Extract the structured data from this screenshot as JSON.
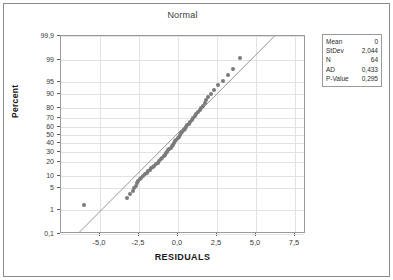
{
  "chart_data": {
    "type": "scatter",
    "title": "Normal",
    "subtitle": "",
    "xlabel": "RESIDUALS",
    "ylabel": "Percent",
    "grid": true,
    "xlim": [
      -7.5,
      8.2
    ],
    "xticks": [
      -5.0,
      -2.5,
      0.0,
      2.5,
      5.0,
      7.5
    ],
    "xticklabels": [
      "-5,0",
      "-2,5",
      "0,0",
      "2,5",
      "5,0",
      "7,5"
    ],
    "yscale": "normal-probability",
    "yticks": [
      0.1,
      1,
      5,
      10,
      20,
      30,
      40,
      50,
      60,
      70,
      80,
      90,
      95,
      99,
      99.9
    ],
    "yticklabels": [
      "0,1",
      "1",
      "5",
      "10",
      "20",
      "30",
      "40",
      "50",
      "60",
      "70",
      "80",
      "90",
      "95",
      "99",
      "99,9"
    ],
    "ylim": [
      0.1,
      99.9
    ],
    "series": [
      {
        "name": "residuals",
        "marker": "circle",
        "color": "#7a7a7a",
        "x": [
          -6.05,
          -3.3,
          -3.05,
          -2.9,
          -2.8,
          -2.72,
          -2.62,
          -2.55,
          -2.45,
          -2.35,
          -2.22,
          -2.1,
          -1.98,
          -1.9,
          -1.8,
          -1.72,
          -1.62,
          -1.52,
          -1.42,
          -1.3,
          -1.2,
          -1.1,
          -1.0,
          -0.92,
          -0.85,
          -0.78,
          -0.7,
          -0.62,
          -0.55,
          -0.48,
          -0.4,
          -0.32,
          -0.25,
          -0.18,
          -0.1,
          -0.02,
          0.05,
          0.12,
          0.2,
          0.28,
          0.35,
          0.42,
          0.5,
          0.58,
          0.68,
          0.78,
          0.88,
          0.98,
          1.08,
          1.18,
          1.28,
          1.38,
          1.48,
          1.58,
          1.7,
          1.82,
          1.95,
          2.1,
          2.3,
          2.55,
          2.85,
          3.2,
          3.55,
          3.95
        ],
        "y": [
          1.5,
          2.4,
          3.2,
          4.0,
          4.9,
          5.7,
          6.6,
          7.4,
          8.3,
          9.1,
          10.0,
          11.0,
          12.0,
          13.0,
          14.0,
          15.0,
          16.0,
          17.0,
          18.0,
          19.5,
          21.0,
          22.5,
          24.0,
          25.5,
          27.0,
          28.5,
          30.0,
          31.5,
          33.0,
          34.5,
          36.0,
          38.0,
          40.0,
          42.0,
          44.0,
          46.0,
          48.0,
          50.0,
          52.0,
          54.0,
          56.0,
          58.0,
          60.0,
          62.0,
          64.0,
          66.0,
          68.0,
          70.0,
          72.0,
          74.0,
          76.0,
          78.0,
          80.0,
          82.0,
          84.0,
          86.0,
          88.0,
          90.0,
          92.0,
          94.0,
          95.5,
          97.0,
          98.0,
          99.2
        ]
      }
    ],
    "fit_line": {
      "name": "normal-fit-line",
      "color": "#8a8a8a",
      "x": [
        -6.3,
        6.3
      ],
      "y": [
        0.1,
        99.9
      ]
    }
  },
  "stats": {
    "rows": [
      {
        "key": "Mean",
        "value": "0"
      },
      {
        "key": "StDev",
        "value": "2,044"
      },
      {
        "key": "N",
        "value": "64"
      },
      {
        "key": "AD",
        "value": "0,433"
      },
      {
        "key": "P-Value",
        "value": "0,295"
      }
    ]
  },
  "colors": {
    "marker": "#7a7a7a",
    "fit_line": "#8a8a8a",
    "grid": "#e2e2e2",
    "frame": "#9a9a9a",
    "text": "#2a2a2a"
  }
}
